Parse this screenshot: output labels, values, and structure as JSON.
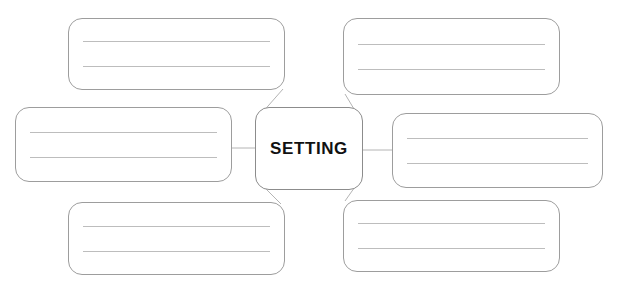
{
  "worksheet": {
    "title": "Setting Graphic Organizer",
    "type": "web-diagram",
    "center_node": {
      "label": "SETTING",
      "shape": "rounded-rectangle",
      "text_style": "bold-uppercase"
    },
    "detail_nodes": [
      {
        "id": "top-left",
        "label": "",
        "writing_lines": 2,
        "position": "top-left"
      },
      {
        "id": "top-right",
        "label": "",
        "writing_lines": 2,
        "position": "top-right"
      },
      {
        "id": "middle-left",
        "label": "",
        "writing_lines": 2,
        "position": "middle-left"
      },
      {
        "id": "middle-right",
        "label": "",
        "writing_lines": 2,
        "position": "middle-right"
      },
      {
        "id": "bottom-left",
        "label": "",
        "writing_lines": 2,
        "position": "bottom-left"
      },
      {
        "id": "bottom-right",
        "label": "",
        "writing_lines": 2,
        "position": "bottom-right"
      }
    ],
    "connectors": [
      {
        "from": "center_node",
        "to": "top-left",
        "style": "diagonal"
      },
      {
        "from": "center_node",
        "to": "top-right",
        "style": "diagonal"
      },
      {
        "from": "center_node",
        "to": "middle-left",
        "style": "horizontal"
      },
      {
        "from": "center_node",
        "to": "middle-right",
        "style": "horizontal"
      },
      {
        "from": "center_node",
        "to": "bottom-left",
        "style": "diagonal"
      },
      {
        "from": "center_node",
        "to": "bottom-right",
        "style": "diagonal"
      }
    ],
    "colors": {
      "page_background": "#ffffff",
      "box_fill": "#ffffff",
      "box_border": "#9d9d9d",
      "hub_border": "#8c8c8c",
      "rule_line": "#bdbdbd",
      "connector": "#b4b4b4",
      "hub_text": "#111111"
    }
  }
}
